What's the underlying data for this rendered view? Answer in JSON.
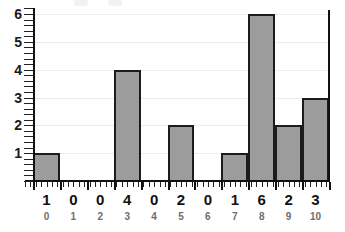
{
  "chart_data": {
    "type": "bar",
    "title": "",
    "subtitle": "",
    "xlabel": "",
    "ylabel": "",
    "categories": [
      "0",
      "1",
      "2",
      "3",
      "4",
      "5",
      "6",
      "7",
      "8",
      "9",
      "10"
    ],
    "values": [
      1,
      0,
      0,
      4,
      0,
      2,
      0,
      1,
      6,
      2,
      3
    ],
    "value_labels": [
      "1",
      "0",
      "0",
      "4",
      "0",
      "2",
      "0",
      "1",
      "6",
      "2",
      "3"
    ],
    "category_labels": [
      "0",
      "1",
      "2",
      "3",
      "4",
      "5",
      "6",
      "7",
      "8",
      "9",
      "10"
    ],
    "ylim": [
      0,
      6
    ],
    "xlim": [
      0,
      11
    ],
    "y_ticks": [
      1,
      2,
      3,
      4,
      5,
      6
    ],
    "y_tick_labels": [
      "1",
      "2",
      "3",
      "4",
      "5",
      "6"
    ],
    "grid": true,
    "grid_axis": "y",
    "legend": false,
    "legend_position": "none",
    "bar_fill_color": "#9c9c9c",
    "bar_border_color": "#1c1c1c",
    "gridline_color": "#ececec",
    "axis_color": "#111111",
    "value_row_color": "#111111",
    "index_row_color": "#6d6d6d",
    "minor_ticks": true
  }
}
